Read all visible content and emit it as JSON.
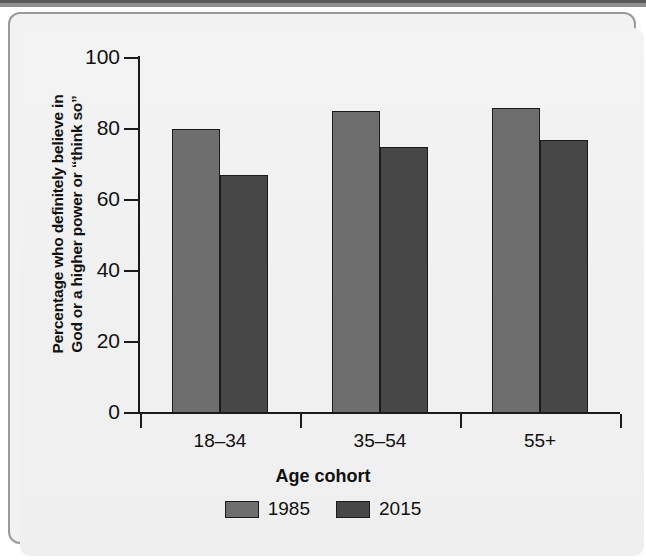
{
  "chart_data": {
    "type": "bar",
    "title": "",
    "xlabel": "Age cohort",
    "ylabel": "Percentage who definitely believe in God or a higher power or “think so”",
    "ylabel_lines": [
      "Percentage who definitely believe in",
      "God or a higher power or “think so”"
    ],
    "categories": [
      "18–34",
      "35–54",
      "55+"
    ],
    "series": [
      {
        "name": "1985",
        "color": "#6e6e6e",
        "values": [
          80,
          85,
          86
        ]
      },
      {
        "name": "2015",
        "color": "#474747",
        "values": [
          67,
          75,
          77
        ]
      }
    ],
    "ylim": [
      0,
      100
    ],
    "yticks": [
      0,
      20,
      40,
      60,
      80,
      100
    ],
    "ytick_labels": [
      "0",
      "20",
      "40",
      "60",
      "80",
      "100"
    ],
    "grid": false,
    "legend_position": "bottom"
  },
  "legend": {
    "items": [
      {
        "label": "1985",
        "color": "#6e6e6e"
      },
      {
        "label": "2015",
        "color": "#474747"
      }
    ]
  },
  "colors": {
    "series_1985": "#6e6e6e",
    "series_2015": "#474747",
    "axis": "#1a1a1a",
    "background": "#f1f1f1",
    "frame_border": "#9a9a9a"
  }
}
